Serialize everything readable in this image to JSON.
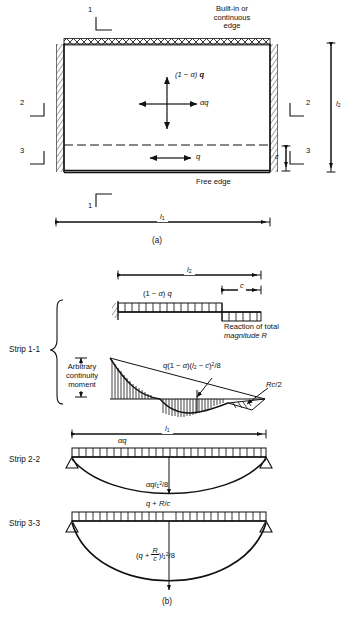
{
  "figure": {
    "panel_a_label": "(a)",
    "panel_b_label": "(b)"
  },
  "panel_a": {
    "built_in_edge_line1": "Built-in or",
    "built_in_edge_line2": "continuous",
    "built_in_edge_line3": "edge",
    "free_edge": "Free edge",
    "section_top": "1",
    "section_bottom": "1",
    "section_left_upper": "2",
    "section_left_lower": "3",
    "section_right_upper": "2",
    "section_right_lower": "3",
    "load_vertical": "(1 − α) q",
    "load_horizontal": "αq",
    "load_strip3": "q",
    "dim_width": "l₁",
    "dim_height": "l₂",
    "dim_strip": "c"
  },
  "panel_b": {
    "strip11": {
      "name": "Strip 1-1",
      "dim_span": "l₂",
      "dim_c": "c",
      "load_label": "(1 − α) q",
      "reaction_line1": "Reaction of total",
      "reaction_line2": "magnitude R",
      "continuity_line1": "Arbitrary",
      "continuity_line2": "continuity",
      "continuity_line3": "moment",
      "moment_span": "q(1 − α)(l₂ − c)²/8",
      "moment_cantilever": "Rc/2"
    },
    "strip22": {
      "name": "Strip 2-2",
      "dim_span": "l₁",
      "load_label": "αq",
      "moment_label": "αql₁²/8"
    },
    "strip33": {
      "name": "Strip 3-3",
      "dim_span": "l₁",
      "load_label": "q + R/c",
      "moment_prefix": "(q + ",
      "moment_frac_num": "R",
      "moment_frac_den": "c",
      "moment_suffix": ")l₁²/8"
    }
  },
  "colors": {
    "ink": "#111111",
    "hatch": "#333333"
  }
}
